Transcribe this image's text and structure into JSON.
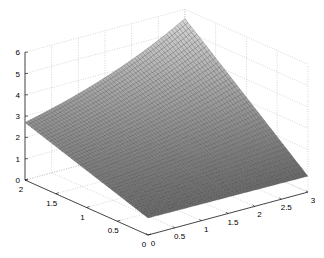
{
  "chart_data": {
    "type": "surface3d",
    "title": "",
    "xlabel": "",
    "ylabel": "",
    "zlabel": "",
    "xlim": [
      0,
      3
    ],
    "ylim": [
      0,
      2
    ],
    "zlim": [
      0,
      6
    ],
    "x_ticks": [
      "0",
      "0.5",
      "1",
      "1.5",
      "2",
      "2.5",
      "3"
    ],
    "y_ticks": [
      "0",
      "0.5",
      "1",
      "1.5",
      "2"
    ],
    "z_ticks": [
      "0",
      "1",
      "2",
      "3",
      "4",
      "5",
      "6"
    ],
    "x_tick_values": [
      0,
      0.5,
      1,
      1.5,
      2,
      2.5,
      3
    ],
    "y_tick_values": [
      0,
      0.5,
      1,
      1.5,
      2
    ],
    "z_tick_values": [
      0,
      1,
      2,
      3,
      4,
      5,
      6
    ],
    "grid": true,
    "colormap": "gray",
    "grid_resolution": {
      "nx": 60,
      "ny": 40
    },
    "corner_values": {
      "x0_y0": 0.8,
      "x3_y0": 0.75,
      "x0_y2": 2.7,
      "x3_y2": 5.6
    },
    "surface_model": {
      "a": 0.8,
      "b": -0.017,
      "c": 0.95,
      "k": 0.31,
      "form": "z = a + b*x + c*y*exp(k*x)"
    },
    "projection": {
      "origin": [
        148,
        235
      ],
      "x_unit": [
        53.3,
        -14.3
      ],
      "y_unit": [
        -61.5,
        -27.5
      ],
      "z_unit": [
        0,
        -21.3
      ]
    }
  }
}
